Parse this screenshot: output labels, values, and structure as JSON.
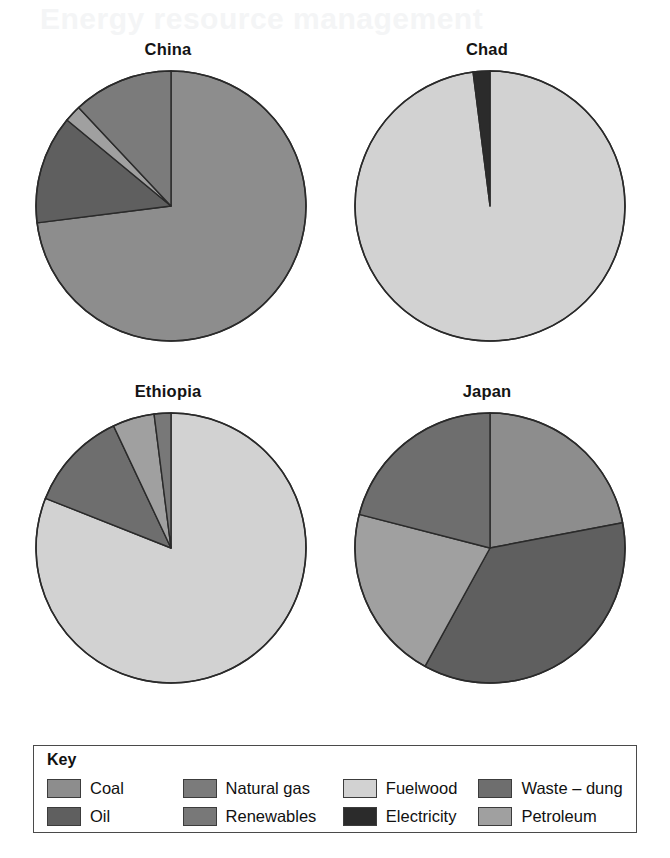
{
  "ghost_header": "Energy resource management",
  "legend": {
    "title": "Key",
    "items": [
      {
        "label": "Coal",
        "color": "#8d8d8d"
      },
      {
        "label": "Natural gas",
        "color": "#7b7b7b"
      },
      {
        "label": "Fuelwood",
        "color": "#d2d2d2"
      },
      {
        "label": "Waste – dung",
        "color": "#6e6e6e"
      },
      {
        "label": "Oil",
        "color": "#5f5f5f"
      },
      {
        "label": "Renewables",
        "color": "#787878"
      },
      {
        "label": "Electricity",
        "color": "#2b2b2b"
      },
      {
        "label": "Petroleum",
        "color": "#a0a0a0"
      }
    ]
  },
  "chart_data": [
    {
      "type": "pie",
      "title": "China",
      "start_angle": 0,
      "direction": "clockwise",
      "legend_position": "bottom",
      "labels": [
        "Coal",
        "Oil",
        "Petroleum",
        "Natural gas"
      ],
      "values": [
        73,
        13,
        2,
        12
      ],
      "colors": [
        "#8d8d8d",
        "#5f5f5f",
        "#a0a0a0",
        "#7b7b7b"
      ],
      "units": "percent"
    },
    {
      "type": "pie",
      "title": "Chad",
      "start_angle": 0,
      "direction": "clockwise",
      "legend_position": "bottom",
      "labels": [
        "Fuelwood",
        "Electricity"
      ],
      "values": [
        98,
        2
      ],
      "colors": [
        "#d2d2d2",
        "#2b2b2b"
      ],
      "units": "percent"
    },
    {
      "type": "pie",
      "title": "Ethiopia",
      "start_angle": 0,
      "direction": "clockwise",
      "legend_position": "bottom",
      "labels": [
        "Fuelwood",
        "Waste – dung",
        "Petroleum",
        "Renewables"
      ],
      "values": [
        81,
        12,
        5,
        2
      ],
      "colors": [
        "#d2d2d2",
        "#6e6e6e",
        "#a0a0a0",
        "#787878"
      ],
      "units": "percent"
    },
    {
      "type": "pie",
      "title": "Japan",
      "start_angle": 0,
      "direction": "clockwise",
      "legend_position": "bottom",
      "labels": [
        "Coal",
        "Oil",
        "Petroleum",
        "Natural gas"
      ],
      "values": [
        22,
        36,
        21,
        21
      ],
      "colors": [
        "#8d8d8d",
        "#5f5f5f",
        "#a0a0a0",
        "#6e6e6e"
      ],
      "units": "percent"
    }
  ]
}
